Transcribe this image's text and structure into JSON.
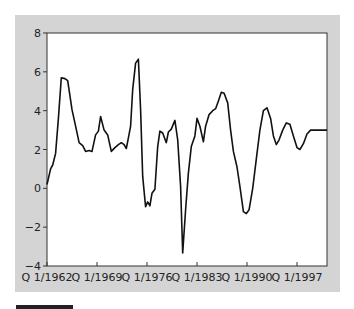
{
  "chart_data": {
    "type": "line",
    "title": "",
    "xlabel": "",
    "ylabel": "",
    "ylim": [
      -4,
      8
    ],
    "xlim": [
      1962.0,
      2001.3
    ],
    "yticks": [
      -4,
      -2,
      0,
      2,
      4,
      6,
      8
    ],
    "ytick_labels": [
      "−4",
      "−2",
      "0",
      "2",
      "4",
      "6",
      "8"
    ],
    "xticks": [
      1962,
      1969,
      1976,
      1983,
      1990,
      1997
    ],
    "xtick_labels": [
      "Q 1/1962",
      "Q 1/1969",
      "Q 1/1976",
      "Q 1/1983",
      "Q 1/1990",
      "Q 1/1997"
    ],
    "grid": false,
    "legend": null,
    "series": [
      {
        "name": "series",
        "color": "#111111",
        "x": [
          1962.0,
          1962.5,
          1962.8,
          1963.2,
          1963.6,
          1964.0,
          1964.5,
          1964.9,
          1965.5,
          1966.0,
          1966.5,
          1967.0,
          1967.4,
          1967.9,
          1968.3,
          1968.8,
          1969.2,
          1969.5,
          1970.0,
          1970.5,
          1971.0,
          1971.5,
          1972.0,
          1972.4,
          1972.8,
          1973.1,
          1973.4,
          1973.7,
          1974.0,
          1974.4,
          1974.8,
          1975.1,
          1975.4,
          1975.8,
          1976.1,
          1976.4,
          1976.7,
          1977.1,
          1977.5,
          1977.8,
          1978.2,
          1978.7,
          1979.0,
          1979.4,
          1979.9,
          1980.3,
          1980.7,
          1981.0,
          1981.4,
          1981.8,
          1982.2,
          1982.7,
          1983.0,
          1983.4,
          1983.9,
          1984.2,
          1984.7,
          1985.2,
          1985.6,
          1986.0,
          1986.4,
          1986.8,
          1987.3,
          1987.7,
          1988.1,
          1988.6,
          1989.0,
          1989.5,
          1989.9,
          1990.3,
          1990.8,
          1991.3,
          1991.8,
          1992.3,
          1992.8,
          1993.3,
          1993.7,
          1994.1,
          1994.5,
          1995.0,
          1995.5,
          1996.0,
          1996.5,
          1997.0,
          1997.4,
          1997.9,
          1998.4,
          1998.9,
          1999.4,
          1999.9,
          2000.4,
          2000.9,
          2001.2
        ],
        "values": [
          0.2,
          1.0,
          1.2,
          1.8,
          3.6,
          5.7,
          5.65,
          5.55,
          4.05,
          3.2,
          2.35,
          2.2,
          1.9,
          1.95,
          1.9,
          2.75,
          2.95,
          3.7,
          3.0,
          2.75,
          1.9,
          2.1,
          2.25,
          2.35,
          2.25,
          2.05,
          2.6,
          3.2,
          5.1,
          6.45,
          6.65,
          4.05,
          0.6,
          -0.95,
          -0.7,
          -0.9,
          -0.25,
          -0.05,
          2.15,
          2.95,
          2.85,
          2.35,
          2.9,
          3.05,
          3.5,
          2.5,
          0.1,
          -3.33,
          -1.1,
          0.8,
          2.15,
          2.7,
          3.6,
          3.2,
          2.4,
          3.2,
          3.8,
          4.0,
          4.1,
          4.5,
          4.95,
          4.9,
          4.4,
          3.0,
          1.9,
          1.1,
          0.1,
          -1.2,
          -1.3,
          -1.1,
          0.0,
          1.5,
          3.0,
          4.0,
          4.15,
          3.6,
          2.7,
          2.25,
          2.5,
          3.0,
          3.37,
          3.3,
          2.7,
          2.1,
          2.0,
          2.3,
          2.8,
          3.0,
          3.0,
          3.0,
          3.0,
          3.0,
          3.0
        ]
      }
    ]
  },
  "page": {
    "panel_color": "#d4d4d4",
    "plot_bg": "#ffffff"
  }
}
